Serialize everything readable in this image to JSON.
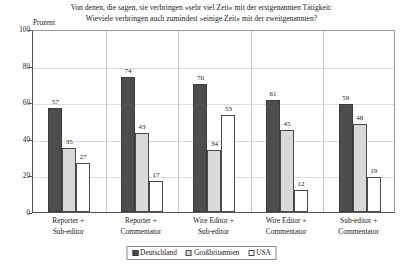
{
  "chart_data": {
    "type": "bar",
    "title": "Von denen, die sagen, sie verbringen »sehr viel Zeit« mit der erstgenannten Tätigkeit: Wievielе verbringen auch zumindest »einige Zeit« mit der zweitgenannten?",
    "title_lines": [
      "Von denen, die sagen, sie verbringen »sehr viel Zeit« mit der erstgenannten Tätigkeit:",
      "Wievielе verbringen auch zumindest »einige Zeit« mit der zweitgenannten?"
    ],
    "xlabel": "",
    "ylabel": "Prozent",
    "ylim": [
      0,
      100
    ],
    "yticks": [
      0,
      20,
      40,
      60,
      80,
      100
    ],
    "grid": true,
    "legend_position": "bottom-center",
    "categories": [
      "Reporter + Sub-editor",
      "Reporter + Commentator",
      "Wire Editor + Sub-editor",
      "Wire Editor + Commentator",
      "Sub-editor + Commentator"
    ],
    "category_lines": [
      [
        "Reporter +",
        "Sub-editor"
      ],
      [
        "Reporter +",
        "Commentator"
      ],
      [
        "Wire Editor +",
        "Sub-editor"
      ],
      [
        "Wire Editor +",
        "Commentator"
      ],
      [
        "Sub-editor +",
        "Commentator"
      ]
    ],
    "series": [
      {
        "name": "Deutschland",
        "color": "#4d4d4d",
        "values": [
          57,
          74,
          70,
          61,
          59
        ]
      },
      {
        "name": "Großbritannien",
        "color": "#d9d9d9",
        "values": [
          35,
          43,
          34,
          45,
          48
        ]
      },
      {
        "name": "USA",
        "color": "#ffffff",
        "values": [
          27,
          17,
          53,
          12,
          19
        ]
      }
    ]
  }
}
